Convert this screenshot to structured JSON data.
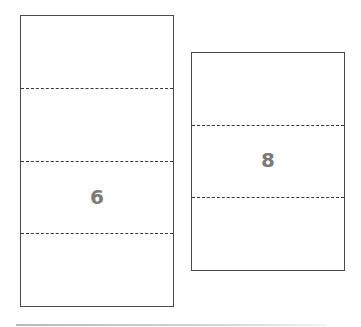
{
  "figure": {
    "rectangles": [
      {
        "id": "left",
        "label": "6",
        "sections": 4,
        "dashed_lines": 3
      },
      {
        "id": "right",
        "label": "8",
        "sections": 3,
        "dashed_lines": 2
      }
    ],
    "colors": {
      "border": "#4a4a4a",
      "dash": "#3a3a3a",
      "label": "#7a7a7a",
      "baseline": "#b8b8b8"
    }
  }
}
